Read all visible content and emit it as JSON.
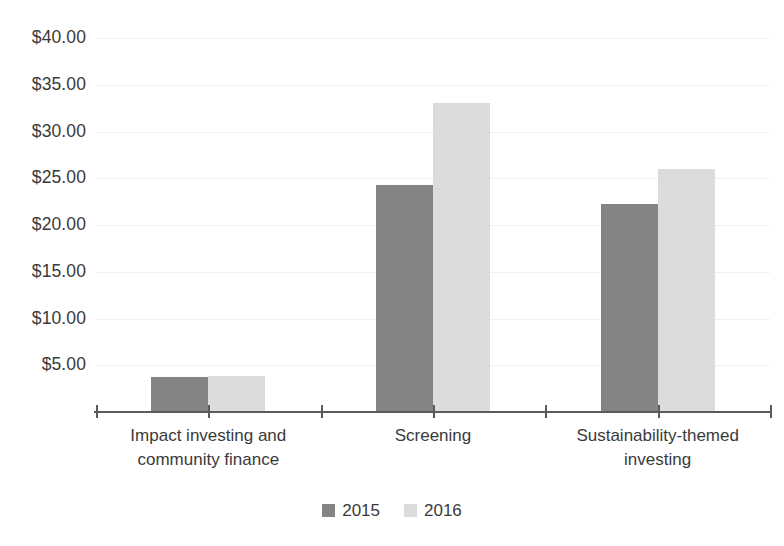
{
  "chart_data": {
    "type": "bar",
    "title": "",
    "subtitle": "",
    "xlabel": "",
    "ylabel": "",
    "categories": [
      "Impact investing and community finance",
      "Screening",
      "Sustainability-themed investing"
    ],
    "category_lines": [
      [
        "Impact investing and",
        "community finance"
      ],
      [
        "Screening",
        ""
      ],
      [
        "Sustainability-themed",
        "investing"
      ]
    ],
    "series": [
      {
        "name": "2015",
        "color": "#848484",
        "values": [
          3.7,
          24.3,
          22.2
        ]
      },
      {
        "name": "2016",
        "color": "#dcdcdc",
        "values": [
          3.9,
          33.0,
          26.0
        ]
      }
    ],
    "ylim": [
      0,
      40
    ],
    "ytick_values": [
      5,
      10,
      15,
      20,
      25,
      30,
      35,
      40
    ],
    "ytick_labels": [
      "$5.00",
      "$10.00",
      "$15.00",
      "$20.00",
      "$25.00",
      "$30.00",
      "$35.00",
      "$40.00"
    ],
    "grid": true,
    "grid_color": "#f1f1f1",
    "legend_position": "bottom",
    "axis_color": "#5b5b5b",
    "text_color": "#3a3a3a",
    "background": "#ffffff"
  },
  "legend": {
    "items": [
      {
        "label": "2015",
        "swatch": "legend-swatch-2015"
      },
      {
        "label": "2016",
        "swatch": "legend-swatch-2016"
      }
    ]
  }
}
